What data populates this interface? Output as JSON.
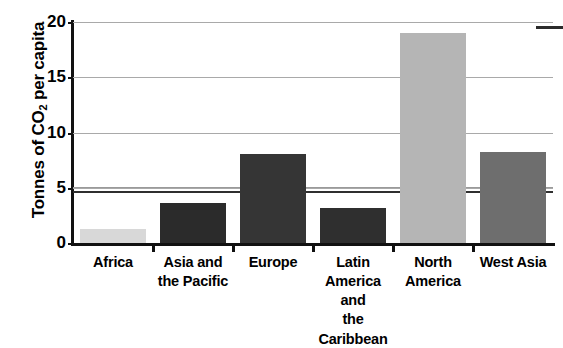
{
  "chart_data": {
    "type": "bar",
    "title": "",
    "xlabel": "",
    "ylabel": "Tonnes of CO2 per capita",
    "ylabel_prefix": "Tonnes of CO",
    "ylabel_subscript": "2",
    "ylabel_suffix": " per capita",
    "ylim": [
      0,
      20
    ],
    "yticks": [
      0,
      5,
      10,
      15,
      20
    ],
    "ytick_labels": [
      "0",
      "5",
      "10",
      "15",
      "20"
    ],
    "grid": true,
    "legend_position": "top-right",
    "categories": [
      "Africa",
      "Asia and the Pacific",
      "Europe",
      "Latin America and the Caribbean",
      "North America",
      "West Asia"
    ],
    "category_label_lines": [
      [
        "Africa"
      ],
      [
        "Asia and",
        "the Pacific"
      ],
      [
        "Europe"
      ],
      [
        "Latin America",
        "and",
        "the Caribbean"
      ],
      [
        "North",
        "America"
      ],
      [
        "West Asia"
      ]
    ],
    "values": [
      1.3,
      3.6,
      8.1,
      3.2,
      19.0,
      8.2
    ],
    "bar_colors": [
      "#d8d8d8",
      "#2b2b2b",
      "#353535",
      "#2f2f2f",
      "#b5b5b5",
      "#6e6e6e"
    ],
    "reference_lines": [
      {
        "name": "world-average-upper",
        "value": 5.1,
        "style": "thin",
        "color": "#9a9a9a"
      },
      {
        "name": "world-average-lower",
        "value": 4.75,
        "style": "thick",
        "color": "#2f2f2f"
      }
    ],
    "legend_entries": [
      {
        "label": "",
        "marker": "line",
        "color": "#2b2b2b"
      }
    ]
  },
  "axis": {
    "y_title": "Tonnes of CO",
    "y_title_sub": "2",
    "y_title_rest": " per capita"
  }
}
